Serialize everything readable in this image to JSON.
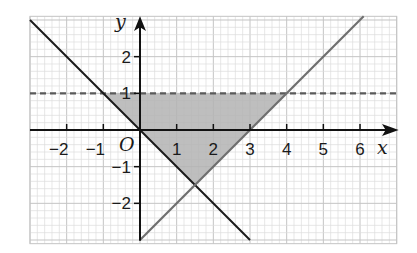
{
  "chart_data": {
    "type": "diagram",
    "title": "",
    "xlabel": "x",
    "ylabel": "y",
    "origin_label": "O",
    "xlim": [
      -3,
      7
    ],
    "ylim": [
      -3.1,
      3.1
    ],
    "grid": true,
    "minor_grid_per_unit": 5,
    "x_tick_labels": [
      "−2",
      "−1",
      "1",
      "2",
      "3",
      "4",
      "5",
      "6"
    ],
    "x_tick_values": [
      -2,
      -1,
      1,
      2,
      3,
      4,
      5,
      6
    ],
    "y_tick_labels": [
      "2",
      "1",
      "−1",
      "−2"
    ],
    "y_tick_values": [
      2,
      1,
      -1,
      -2
    ],
    "lines": [
      {
        "name": "y = -x",
        "style": "solid",
        "color": "#1a1a1a",
        "from": [
          -3,
          3
        ],
        "to": [
          3,
          -3
        ]
      },
      {
        "name": "y = x - 3",
        "style": "solid",
        "color": "#6f6f6f",
        "from": [
          0,
          -3
        ],
        "to": [
          6.1,
          3.1
        ]
      },
      {
        "name": "y = 1",
        "style": "dashed",
        "color": "#5a5a5a",
        "from": [
          -3,
          1
        ],
        "to": [
          7,
          1
        ]
      }
    ],
    "shaded_region": {
      "vertices": [
        [
          -1,
          1
        ],
        [
          4,
          1
        ],
        [
          1.5,
          -1.5
        ]
      ],
      "color": "#b3b3b3",
      "description": "y < 1, y > -x, y > x - 3"
    }
  },
  "labels": {
    "x_axis": "x",
    "y_axis": "y",
    "origin": "O",
    "x_ticks": [
      "−2",
      "−1",
      "1",
      "2",
      "3",
      "4",
      "5",
      "6"
    ],
    "y_ticks": [
      "2",
      "1",
      "−1",
      "−2"
    ]
  },
  "colors": {
    "grid_minor": "#dcdcdc",
    "grid_major": "#c4c4c4",
    "axis": "#111111",
    "shade": "#b3b3b3",
    "line_black": "#1a1a1a",
    "line_gray": "#6f6f6f",
    "dash": "#5a5a5a"
  }
}
